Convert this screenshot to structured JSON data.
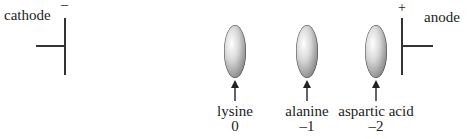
{
  "electrodes": {
    "cathode": {
      "label": "cathode",
      "sign": "–"
    },
    "anode": {
      "label": "anode",
      "sign": "+"
    }
  },
  "samples": [
    {
      "name": "lysine",
      "charge": "0"
    },
    {
      "name": "alanine",
      "charge": "–1"
    },
    {
      "name": "aspartic acid",
      "charge": "–2"
    }
  ]
}
